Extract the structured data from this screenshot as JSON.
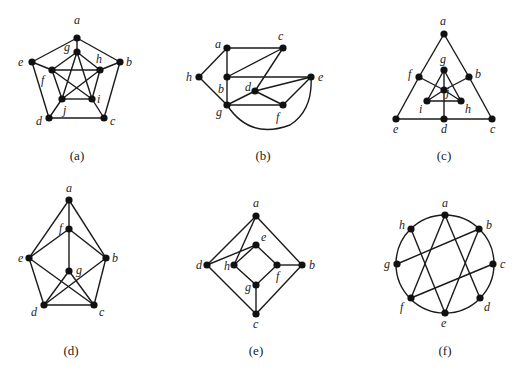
{
  "figure": {
    "graphs": [
      {
        "id": "a",
        "caption": "(a)",
        "caption_pos": [
          77,
          160
        ],
        "nodes": [
          {
            "n": "a",
            "x": 77,
            "y": 38,
            "lx": 74,
            "ly": 24
          },
          {
            "n": "g",
            "x": 77,
            "y": 52,
            "lx": 64,
            "ly": 51
          },
          {
            "n": "e",
            "x": 32,
            "y": 62,
            "lx": 18,
            "ly": 66
          },
          {
            "n": "b",
            "x": 120,
            "y": 62,
            "lx": 126,
            "ly": 66
          },
          {
            "n": "f",
            "x": 52,
            "y": 70,
            "lx": 41,
            "ly": 84
          },
          {
            "n": "h",
            "x": 100,
            "y": 70,
            "lx": 96,
            "ly": 63
          },
          {
            "n": "j",
            "x": 62,
            "y": 99,
            "lx": 63,
            "ly": 114
          },
          {
            "n": "i",
            "x": 92,
            "y": 99,
            "lx": 97,
            "ly": 103
          },
          {
            "n": "d",
            "x": 49,
            "y": 118,
            "lx": 36,
            "ly": 125
          },
          {
            "n": "c",
            "x": 104,
            "y": 118,
            "lx": 110,
            "ly": 125
          }
        ],
        "edges": [
          [
            "a",
            "b"
          ],
          [
            "a",
            "e"
          ],
          [
            "a",
            "g"
          ],
          [
            "b",
            "c"
          ],
          [
            "b",
            "h"
          ],
          [
            "c",
            "d"
          ],
          [
            "c",
            "i"
          ],
          [
            "d",
            "e"
          ],
          [
            "d",
            "j"
          ],
          [
            "e",
            "f"
          ],
          [
            "f",
            "h"
          ],
          [
            "f",
            "g"
          ],
          [
            "f",
            "i"
          ],
          [
            "f",
            "j"
          ],
          [
            "g",
            "h"
          ],
          [
            "g",
            "j"
          ],
          [
            "g",
            "i"
          ],
          [
            "h",
            "i"
          ],
          [
            "h",
            "j"
          ],
          [
            "i",
            "j"
          ]
        ]
      },
      {
        "id": "b",
        "caption": "(b)",
        "caption_pos": [
          263,
          160
        ],
        "nodes": [
          {
            "n": "a",
            "x": 227,
            "y": 48,
            "lx": 215,
            "ly": 48
          },
          {
            "n": "c",
            "x": 283,
            "y": 48,
            "lx": 278,
            "ly": 40
          },
          {
            "n": "h",
            "x": 199,
            "y": 77,
            "lx": 186,
            "ly": 81
          },
          {
            "n": "b",
            "x": 227,
            "y": 77,
            "lx": 218,
            "ly": 93
          },
          {
            "n": "e",
            "x": 311,
            "y": 77,
            "lx": 318,
            "ly": 81
          },
          {
            "n": "d",
            "x": 255,
            "y": 91,
            "lx": 245,
            "ly": 91
          },
          {
            "n": "g",
            "x": 227,
            "y": 105,
            "lx": 216,
            "ly": 116
          },
          {
            "n": "f",
            "x": 283,
            "y": 105,
            "lx": 276,
            "ly": 121
          }
        ],
        "edges": [
          [
            "a",
            "c"
          ],
          [
            "a",
            "b"
          ],
          [
            "a",
            "h"
          ],
          [
            "h",
            "g"
          ],
          [
            "b",
            "g"
          ],
          [
            "b",
            "c"
          ],
          [
            "b",
            "e"
          ],
          [
            "c",
            "d"
          ],
          [
            "d",
            "e"
          ],
          [
            "d",
            "f"
          ],
          [
            "d",
            "g"
          ],
          [
            "g",
            "f"
          ],
          [
            "f",
            "e"
          ]
        ],
        "curved_edges": [
          {
            "from": "g",
            "to": "e",
            "path": "M227,105 Q250,140 290,125 Q313,110 311,77"
          }
        ]
      },
      {
        "id": "c",
        "caption": "(c)",
        "caption_pos": [
          444,
          160
        ],
        "nodes": [
          {
            "n": "a",
            "x": 444,
            "y": 34,
            "lx": 440,
            "ly": 25
          },
          {
            "n": "g",
            "x": 444,
            "y": 70,
            "lx": 440,
            "ly": 63
          },
          {
            "n": "f",
            "x": 419,
            "y": 77,
            "lx": 408,
            "ly": 78
          },
          {
            "n": "b",
            "x": 469,
            "y": 77,
            "lx": 475,
            "ly": 78
          },
          {
            "n": "j",
            "x": 444,
            "y": 90,
            "lx": 446,
            "ly": 96
          },
          {
            "n": "i",
            "x": 427,
            "y": 101,
            "lx": 419,
            "ly": 113
          },
          {
            "n": "h",
            "x": 461,
            "y": 101,
            "lx": 465,
            "ly": 113
          },
          {
            "n": "e",
            "x": 396,
            "y": 119,
            "lx": 393,
            "ly": 133
          },
          {
            "n": "d",
            "x": 444,
            "y": 119,
            "lx": 441,
            "ly": 133
          },
          {
            "n": "c",
            "x": 492,
            "y": 119,
            "lx": 490,
            "ly": 133
          }
        ],
        "edges": [
          [
            "a",
            "f"
          ],
          [
            "f",
            "e"
          ],
          [
            "a",
            "b"
          ],
          [
            "b",
            "c"
          ],
          [
            "e",
            "d"
          ],
          [
            "d",
            "c"
          ],
          [
            "f",
            "j"
          ],
          [
            "b",
            "j"
          ],
          [
            "g",
            "i"
          ],
          [
            "g",
            "h"
          ],
          [
            "g",
            "j"
          ],
          [
            "i",
            "h"
          ],
          [
            "i",
            "j"
          ],
          [
            "h",
            "j"
          ],
          [
            "j",
            "d"
          ]
        ]
      },
      {
        "id": "d",
        "caption": "(d)",
        "caption_pos": [
          71,
          355
        ],
        "nodes": [
          {
            "n": "a",
            "x": 69,
            "y": 200,
            "lx": 66,
            "ly": 192
          },
          {
            "n": "f",
            "x": 69,
            "y": 229,
            "lx": 59,
            "ly": 232
          },
          {
            "n": "e",
            "x": 29,
            "y": 258,
            "lx": 18,
            "ly": 262
          },
          {
            "n": "b",
            "x": 106,
            "y": 258,
            "lx": 112,
            "ly": 262
          },
          {
            "n": "g",
            "x": 69,
            "y": 271,
            "lx": 76,
            "ly": 274
          },
          {
            "n": "d",
            "x": 44,
            "y": 305,
            "lx": 31,
            "ly": 316
          },
          {
            "n": "c",
            "x": 94,
            "y": 305,
            "lx": 99,
            "ly": 316
          }
        ],
        "edges": [
          [
            "a",
            "f"
          ],
          [
            "a",
            "e"
          ],
          [
            "a",
            "b"
          ],
          [
            "f",
            "e"
          ],
          [
            "f",
            "b"
          ],
          [
            "f",
            "g"
          ],
          [
            "e",
            "d"
          ],
          [
            "e",
            "c"
          ],
          [
            "b",
            "c"
          ],
          [
            "b",
            "d"
          ],
          [
            "g",
            "d"
          ],
          [
            "g",
            "c"
          ],
          [
            "d",
            "c"
          ]
        ]
      },
      {
        "id": "e",
        "caption": "(e)",
        "caption_pos": [
          256,
          355
        ],
        "nodes": [
          {
            "n": "a",
            "x": 256,
            "y": 216,
            "lx": 253,
            "ly": 207
          },
          {
            "n": "e",
            "x": 256,
            "y": 245,
            "lx": 261,
            "ly": 241
          },
          {
            "n": "d",
            "x": 207,
            "y": 265,
            "lx": 196,
            "ly": 269
          },
          {
            "n": "h",
            "x": 234,
            "y": 265,
            "lx": 224,
            "ly": 270
          },
          {
            "n": "f",
            "x": 277,
            "y": 265,
            "lx": 276,
            "ly": 280
          },
          {
            "n": "b",
            "x": 302,
            "y": 265,
            "lx": 309,
            "ly": 269
          },
          {
            "n": "g",
            "x": 256,
            "y": 285,
            "lx": 245,
            "ly": 291
          },
          {
            "n": "c",
            "x": 256,
            "y": 314,
            "lx": 253,
            "ly": 328
          }
        ],
        "edges": [
          [
            "a",
            "d"
          ],
          [
            "a",
            "h"
          ],
          [
            "a",
            "b"
          ],
          [
            "d",
            "e"
          ],
          [
            "h",
            "e"
          ],
          [
            "e",
            "f"
          ],
          [
            "f",
            "b"
          ],
          [
            "h",
            "g"
          ],
          [
            "g",
            "f"
          ],
          [
            "g",
            "c"
          ],
          [
            "d",
            "c"
          ],
          [
            "b",
            "c"
          ]
        ]
      },
      {
        "id": "f",
        "caption": "(f)",
        "caption_pos": [
          445,
          355
        ],
        "circle": {
          "cx": 445,
          "cy": 264,
          "r": 49
        },
        "nodes": [
          {
            "n": "a",
            "x": 445,
            "y": 215,
            "lx": 442,
            "ly": 207
          },
          {
            "n": "b",
            "x": 479,
            "y": 229,
            "lx": 486,
            "ly": 229
          },
          {
            "n": "c",
            "x": 493,
            "y": 264,
            "lx": 500,
            "ly": 268
          },
          {
            "n": "d",
            "x": 480,
            "y": 298,
            "lx": 484,
            "ly": 311
          },
          {
            "n": "e",
            "x": 445,
            "y": 313,
            "lx": 441,
            "ly": 327
          },
          {
            "n": "f",
            "x": 411,
            "y": 298,
            "lx": 400,
            "ly": 311
          },
          {
            "n": "g",
            "x": 397,
            "y": 264,
            "lx": 384,
            "ly": 268
          },
          {
            "n": "h",
            "x": 411,
            "y": 229,
            "lx": 399,
            "ly": 229
          }
        ],
        "edges": [
          [
            "a",
            "f"
          ],
          [
            "a",
            "d"
          ],
          [
            "h",
            "e"
          ],
          [
            "b",
            "g"
          ],
          [
            "b",
            "e"
          ],
          [
            "c",
            "f"
          ]
        ]
      }
    ]
  }
}
